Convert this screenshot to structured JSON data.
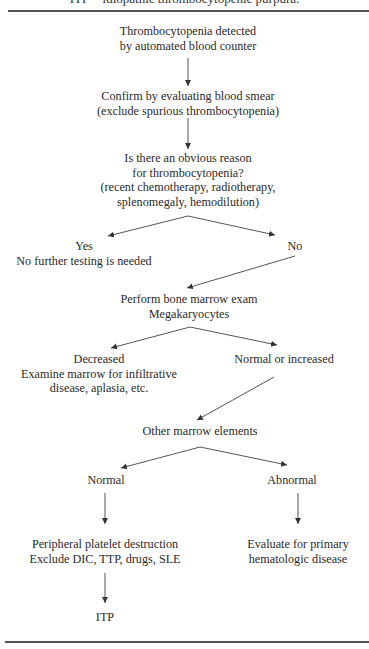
{
  "caption": "ITP = idiopathic thrombocytopenic purpura.",
  "colors": {
    "text": "#2a2a2a",
    "line": "#555555",
    "background": "#ffffff"
  },
  "nodes": {
    "detected": {
      "lines": [
        "Thrombocytopenia detected",
        "by automated blood counter"
      ]
    },
    "confirm": {
      "lines": [
        "Confirm by evaluating blood smear",
        "(exclude spurious thrombocytopenia)"
      ]
    },
    "obvious_reason": {
      "lines": [
        "Is there an obvious reason",
        "for thrombocytopenia?",
        "(recent chemotherapy, radiotherapy,",
        "splenomegaly, hemodilution)"
      ]
    },
    "yes": {
      "lines": [
        "Yes",
        "No further testing is needed"
      ]
    },
    "no": {
      "lines": [
        "No"
      ]
    },
    "bone_marrow": {
      "lines": [
        "Perform bone marrow exam",
        "Megakaryocytes"
      ]
    },
    "decreased": {
      "lines": [
        "Decreased",
        "Examine marrow for infiltrative",
        "disease, aplasia, etc."
      ]
    },
    "normal_increased": {
      "lines": [
        "Normal or increased"
      ]
    },
    "other_marrow": {
      "lines": [
        "Other marrow elements"
      ]
    },
    "normal": {
      "lines": [
        "Normal"
      ]
    },
    "abnormal": {
      "lines": [
        "Abnormal"
      ]
    },
    "peripheral": {
      "lines": [
        "Peripheral platelet destruction",
        "Exclude DIC, TTP, drugs, SLE"
      ]
    },
    "evaluate_primary": {
      "lines": [
        "Evaluate for primary",
        "hematologic disease"
      ]
    },
    "itp": {
      "lines": [
        "ITP"
      ]
    }
  },
  "edges": [
    [
      "detected",
      "confirm"
    ],
    [
      "confirm",
      "obvious_reason"
    ],
    [
      "obvious_reason",
      "yes"
    ],
    [
      "obvious_reason",
      "no"
    ],
    [
      "no",
      "bone_marrow"
    ],
    [
      "bone_marrow",
      "decreased"
    ],
    [
      "bone_marrow",
      "normal_increased"
    ],
    [
      "normal_increased",
      "other_marrow"
    ],
    [
      "other_marrow",
      "normal"
    ],
    [
      "other_marrow",
      "abnormal"
    ],
    [
      "normal",
      "peripheral"
    ],
    [
      "abnormal",
      "evaluate_primary"
    ],
    [
      "peripheral",
      "itp"
    ]
  ]
}
